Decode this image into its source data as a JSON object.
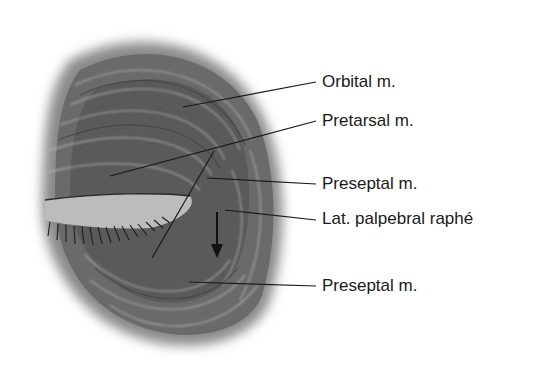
{
  "figure": {
    "labels": [
      {
        "id": "orbital",
        "text": "Orbital m.",
        "x": 322,
        "y": 70,
        "line": [
          183,
          107,
          316,
          82
        ]
      },
      {
        "id": "pretarsal",
        "text": "Pretarsal m.",
        "x": 322,
        "y": 109,
        "line": [
          110,
          176,
          316,
          121
        ]
      },
      {
        "id": "preseptal_upper",
        "text": "Preseptal m.",
        "x": 322,
        "y": 173,
        "line": [
          207,
          178,
          316,
          184
        ]
      },
      {
        "id": "lat_palpebral_raphe",
        "text": "Lat. palpebral raphé",
        "x": 322,
        "y": 207,
        "line": [
          225,
          210,
          316,
          220
        ]
      },
      {
        "id": "preseptal_lower",
        "text": "Preseptal m.",
        "x": 322,
        "y": 276,
        "line": [
          189,
          282,
          316,
          286
        ]
      }
    ],
    "colors": {
      "muscle_dark": "#3f3f3f",
      "muscle_mid": "#7a7a7a",
      "muscle_light": "#bdbdbd",
      "leader": "#1a1a1a"
    }
  }
}
